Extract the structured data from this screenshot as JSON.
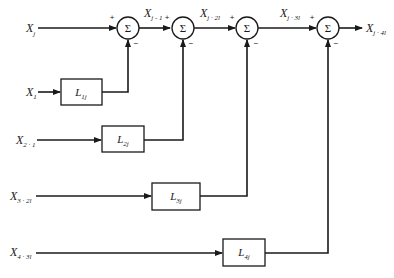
{
  "diagram": {
    "type": "block-diagram",
    "summers": [
      {
        "id": "sum1",
        "symbol": "Σ",
        "plus": "+",
        "minus": "−"
      },
      {
        "id": "sum2",
        "symbol": "Σ",
        "plus": "+",
        "minus": "−"
      },
      {
        "id": "sum3",
        "symbol": "Σ",
        "plus": "+",
        "minus": "−"
      },
      {
        "id": "sum4",
        "symbol": "Σ",
        "plus": "+",
        "minus": "−"
      }
    ],
    "main_signals": [
      {
        "base": "X",
        "sub": "j"
      },
      {
        "base": "X",
        "sub": "j - 1"
      },
      {
        "base": "X",
        "sub": "j · 2l"
      },
      {
        "base": "X",
        "sub": "j · 3l"
      },
      {
        "base": "X",
        "sub": "j · 4l"
      }
    ],
    "inputs": [
      {
        "base": "X",
        "sub": "1"
      },
      {
        "base": "X",
        "sub": "2 · 1"
      },
      {
        "base": "X",
        "sub": "3 · 2l"
      },
      {
        "base": "X",
        "sub": "4 · 3l"
      }
    ],
    "blocks": [
      {
        "base": "L",
        "sub": "1j"
      },
      {
        "base": "L",
        "sub": "2j"
      },
      {
        "base": "L",
        "sub": "3j"
      },
      {
        "base": "L",
        "sub": "4j"
      }
    ],
    "edges": [
      {
        "from": "X_j",
        "to": "sum1",
        "sign": "+"
      },
      {
        "from": "sum1",
        "to": "sum2",
        "label": "X_{j-1}",
        "sign": "+"
      },
      {
        "from": "sum2",
        "to": "sum3",
        "label": "X_{j-2l}",
        "sign": "+"
      },
      {
        "from": "sum3",
        "to": "sum4",
        "label": "X_{j-3l}",
        "sign": "+"
      },
      {
        "from": "sum4",
        "to": "output",
        "label": "X_{j-4l}"
      },
      {
        "from": "X_1",
        "to": "L_1j"
      },
      {
        "from": "L_1j",
        "to": "sum1",
        "sign": "−"
      },
      {
        "from": "X_{2-1}",
        "to": "L_2j"
      },
      {
        "from": "L_2j",
        "to": "sum2",
        "sign": "−"
      },
      {
        "from": "X_{3-2l}",
        "to": "L_3j"
      },
      {
        "from": "L_3j",
        "to": "sum3",
        "sign": "−"
      },
      {
        "from": "X_{4-3l}",
        "to": "L_4j"
      },
      {
        "from": "L_4j",
        "to": "sum4",
        "sign": "−"
      }
    ]
  }
}
